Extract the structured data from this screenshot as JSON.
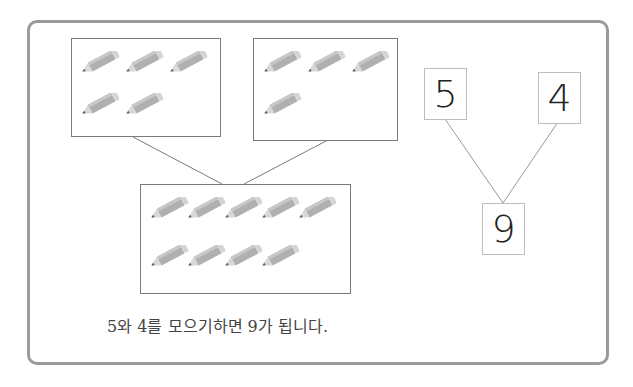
{
  "groups": [
    {
      "id": "left",
      "count": 5,
      "rows": [
        3,
        2
      ]
    },
    {
      "id": "right",
      "count": 4,
      "rows": [
        3,
        1
      ]
    },
    {
      "id": "total",
      "count": 9,
      "rows": [
        5,
        4
      ]
    }
  ],
  "number_bond": {
    "part1": "5",
    "part2": "4",
    "whole": "9"
  },
  "caption": "5와 4를 모으기하면 9가 됩니다.",
  "colors": {
    "frame": "#9a9a9a",
    "box_border": "#7a7a7a",
    "pencil": "#b0b0b0"
  },
  "icons": {
    "pencil": "pencil-icon"
  }
}
